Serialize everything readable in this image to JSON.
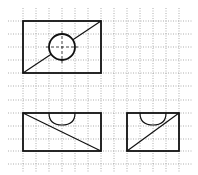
{
  "diagram": {
    "colors": {
      "background": "#ffffff",
      "grid": "#8a8a8a",
      "stroke": "#111111"
    },
    "grid": {
      "vertical_x": [
        23,
        36,
        49,
        62,
        75,
        88,
        101,
        114,
        127,
        140,
        153,
        166,
        179
      ],
      "horizontal_y": [
        21,
        34,
        47,
        60,
        73,
        86,
        100,
        113,
        126,
        139,
        151,
        164
      ],
      "spacing": 13
    },
    "views": [
      {
        "name": "top-view",
        "rect": {
          "x": 23,
          "y": 21,
          "w": 78,
          "h": 52
        },
        "diagonal": [
          [
            23,
            73
          ],
          [
            101,
            21
          ]
        ],
        "circle": {
          "cx": 62,
          "cy": 47,
          "r": 13
        }
      },
      {
        "name": "front-view",
        "rect": {
          "x": 23,
          "y": 113,
          "w": 78,
          "h": 38
        },
        "diagonal": [
          [
            23,
            113
          ],
          [
            101,
            151
          ]
        ],
        "half_circle": {
          "x1": 49,
          "x2": 75,
          "y": 113,
          "depth": 12
        }
      },
      {
        "name": "side-view",
        "rect": {
          "x": 127,
          "y": 113,
          "w": 52,
          "h": 38
        },
        "diagonal": [
          [
            127,
            151
          ],
          [
            179,
            113
          ]
        ],
        "half_circle": {
          "x1": 140,
          "x2": 166,
          "y": 113,
          "depth": 12
        }
      }
    ]
  }
}
